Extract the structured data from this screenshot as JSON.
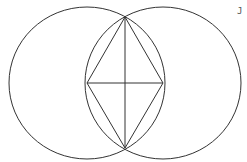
{
  "figure": {
    "label": "J",
    "stroke_color": "#333333",
    "background": "#ffffff"
  },
  "shapes": {
    "left_circle": {
      "cx": 87,
      "cy": 83,
      "rx": 78,
      "ry": 76
    },
    "right_circle": {
      "cx": 163,
      "cy": 83,
      "rx": 78,
      "ry": 76
    },
    "rhombus": {
      "top": [
        125,
        17
      ],
      "right": [
        163,
        83
      ],
      "bottom": [
        125,
        148
      ],
      "left": [
        87,
        83
      ]
    },
    "vertical_diagonal": {
      "x1": 125,
      "y1": 17,
      "x2": 125,
      "y2": 148
    },
    "horizontal_diagonal": {
      "x1": 87,
      "y1": 83,
      "x2": 163,
      "y2": 83
    }
  }
}
